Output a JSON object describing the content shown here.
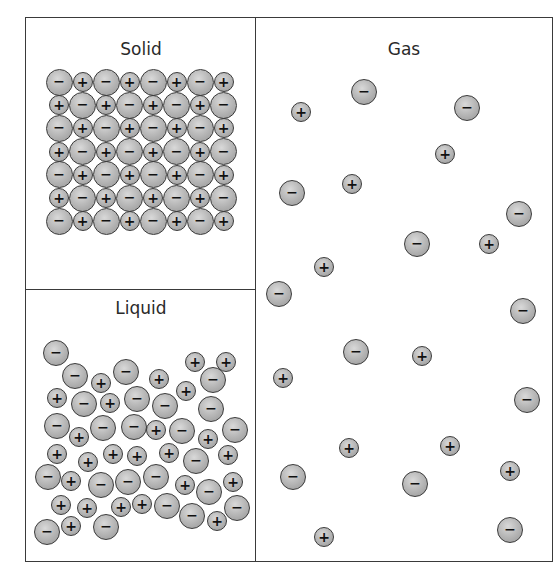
{
  "diagram": {
    "colors": {
      "particle_fill": "#b3b3b3",
      "particle_outline": "#3a3a3a",
      "border": "#3a3a3a",
      "text": "#2a2a2a"
    },
    "symbols": {
      "anion": "−",
      "cation": "+"
    },
    "panels": {
      "solid": {
        "title": "Solid",
        "rows": 7,
        "cols": 8,
        "layout": "ordered lattice, alternating − and + ions; rows start alternately with − and +",
        "origin": [
          59,
          82
        ],
        "pitch_x": 23.5,
        "pitch_y": 23.2
      },
      "liquid": {
        "title": "Liquid",
        "particles": [
          [
            "-",
            56,
            353
          ],
          [
            "-",
            75,
            376
          ],
          [
            "+",
            101,
            383
          ],
          [
            "-",
            126,
            372
          ],
          [
            "+",
            159,
            379
          ],
          [
            "+",
            195,
            362
          ],
          [
            "+",
            226,
            362
          ],
          [
            "-",
            213,
            380
          ],
          [
            "+",
            186,
            391
          ],
          [
            "+",
            57,
            398
          ],
          [
            "-",
            84,
            404
          ],
          [
            "+",
            110,
            403
          ],
          [
            "-",
            137,
            399
          ],
          [
            "-",
            165,
            406
          ],
          [
            "-",
            211,
            409
          ],
          [
            "-",
            57,
            426
          ],
          [
            "+",
            79,
            437
          ],
          [
            "-",
            103,
            428
          ],
          [
            "-",
            134,
            427
          ],
          [
            "+",
            156,
            430
          ],
          [
            "-",
            182,
            431
          ],
          [
            "+",
            208,
            439
          ],
          [
            "-",
            235,
            430
          ],
          [
            "+",
            57,
            454
          ],
          [
            "+",
            88,
            462
          ],
          [
            "+",
            113,
            454
          ],
          [
            "+",
            137,
            456
          ],
          [
            "+",
            169,
            453
          ],
          [
            "-",
            196,
            461
          ],
          [
            "+",
            228,
            455
          ],
          [
            "-",
            48,
            477
          ],
          [
            "+",
            71,
            481
          ],
          [
            "-",
            101,
            485
          ],
          [
            "-",
            128,
            482
          ],
          [
            "-",
            156,
            477
          ],
          [
            "+",
            185,
            485
          ],
          [
            "-",
            209,
            492
          ],
          [
            "+",
            233,
            482
          ],
          [
            "+",
            61,
            505
          ],
          [
            "+",
            87,
            508
          ],
          [
            "+",
            121,
            507
          ],
          [
            "+",
            142,
            504
          ],
          [
            "-",
            167,
            506
          ],
          [
            "-",
            192,
            516
          ],
          [
            "+",
            217,
            521
          ],
          [
            "-",
            237,
            508
          ],
          [
            "-",
            47,
            532
          ],
          [
            "+",
            71,
            526
          ],
          [
            "-",
            106,
            527
          ]
        ]
      },
      "gas": {
        "title": "Gas",
        "particles": [
          [
            "+",
            301,
            112
          ],
          [
            "-",
            364,
            92
          ],
          [
            "-",
            467,
            108
          ],
          [
            "+",
            445,
            154
          ],
          [
            "-",
            292,
            193
          ],
          [
            "+",
            352,
            184
          ],
          [
            "-",
            519,
            214
          ],
          [
            "-",
            417,
            244
          ],
          [
            "+",
            489,
            244
          ],
          [
            "+",
            324,
            267
          ],
          [
            "-",
            279,
            294
          ],
          [
            "-",
            523,
            311
          ],
          [
            "-",
            356,
            352
          ],
          [
            "+",
            422,
            356
          ],
          [
            "+",
            283,
            378
          ],
          [
            "-",
            527,
            400
          ],
          [
            "+",
            349,
            448
          ],
          [
            "+",
            450,
            446
          ],
          [
            "-",
            293,
            477
          ],
          [
            "-",
            415,
            484
          ],
          [
            "+",
            510,
            471
          ],
          [
            "-",
            510,
            530
          ],
          [
            "+",
            324,
            537
          ]
        ]
      }
    }
  }
}
